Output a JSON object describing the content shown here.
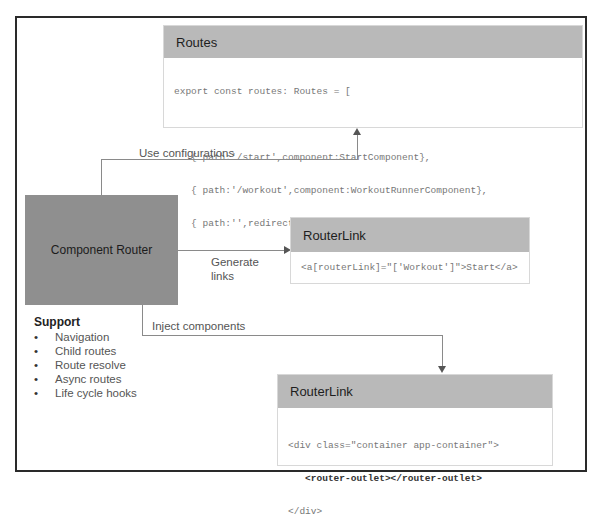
{
  "diagram": {
    "routes_box": {
      "title": "Routes",
      "code_lines": [
        "export const routes: Routes = [",
        "",
        "   { path:'/start',component:StartComponent},",
        "   { path:'/workout',component:WorkoutRunnerComponent},",
        "   { path:'',redirectTo: '/start', pathMatch: 'Prefix'}]"
      ]
    },
    "component_router": {
      "label": "Component Router"
    },
    "router_link_box": {
      "title": "RouterLink",
      "code": "<a[routerLink]=\"['Workout']\">Start</a>"
    },
    "router_outlet_box": {
      "title": "RouterLink",
      "code_line1": "<div class=\"container app-container\">",
      "code_line2": "   <router-outlet></router-outlet>",
      "code_line3": "</div>"
    },
    "edges": {
      "use_configurations": "Use configurations",
      "generate_links_1": "Generate",
      "generate_links_2": "links",
      "inject_components": "Inject components"
    },
    "support": {
      "title": "Support",
      "items": [
        "Navigation",
        "Child routes",
        "Route resolve",
        "Async routes",
        "Life cycle hooks"
      ]
    }
  }
}
